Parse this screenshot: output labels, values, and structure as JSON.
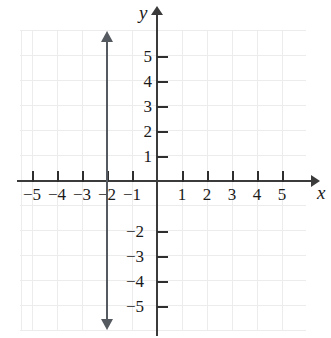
{
  "chart_data": {
    "type": "line",
    "title": "",
    "xlabel": "x",
    "ylabel": "y",
    "xlim": [
      -5.6,
      6.4
    ],
    "ylim": [
      -6.0,
      6.8
    ],
    "grid": true,
    "legend": "none",
    "x_ticks": [
      -5,
      -4,
      -3,
      -2,
      -1,
      1,
      2,
      3,
      4,
      5
    ],
    "y_ticks": [
      5,
      4,
      3,
      2,
      1,
      -2,
      -3,
      -4,
      -5
    ],
    "x_tick_labels": [
      "−5",
      "−4",
      "−3",
      "−2",
      "−1",
      "1",
      "2",
      "3",
      "4",
      "5"
    ],
    "y_tick_labels": [
      "5",
      "4",
      "3",
      "2",
      "1",
      "−2",
      "−3",
      "−4",
      "−5"
    ],
    "series": [
      {
        "name": "x = -2",
        "equation": "x = −2",
        "orientation": "vertical",
        "x_intercept": -2,
        "x": [
          -2,
          -2
        ],
        "y": [
          -6.0,
          6.0
        ],
        "arrows": "both",
        "color": "#555a60"
      }
    ],
    "annotations": [],
    "axis_color": "#3b3b3b",
    "grid_color": "#e9e9e9"
  },
  "axes": {
    "x_name": "x",
    "y_name": "y"
  },
  "x_labels": [
    {
      "text": "−5",
      "left": 21
    },
    {
      "text": "−4",
      "left": 46
    },
    {
      "text": "−3",
      "left": 71
    },
    {
      "text": "−2",
      "left": 96
    },
    {
      "text": "−1",
      "left": 121
    },
    {
      "text": "1",
      "left": 171
    },
    {
      "text": "2",
      "left": 196
    },
    {
      "text": "3",
      "left": 221
    },
    {
      "text": "4",
      "left": 246
    },
    {
      "text": "5",
      "left": 271
    }
  ],
  "y_labels": [
    {
      "text": "5",
      "top": 48,
      "left": 126
    },
    {
      "text": "4",
      "top": 73,
      "left": 126
    },
    {
      "text": "3",
      "top": 98,
      "left": 126
    },
    {
      "text": "2",
      "top": 123,
      "left": 126
    },
    {
      "text": "1",
      "top": 148,
      "left": 126
    },
    {
      "text": "−2",
      "top": 223,
      "left": 118
    },
    {
      "text": "−3",
      "top": 248,
      "left": 118
    },
    {
      "text": "−4",
      "top": 273,
      "left": 118
    },
    {
      "text": "−5",
      "top": 298,
      "left": 118
    }
  ],
  "x_ticks_px": [
    32,
    57,
    82,
    107,
    132,
    182,
    207,
    232,
    257,
    282
  ],
  "y_ticks_px": [
    56,
    81,
    106,
    131,
    156,
    231,
    256,
    281,
    306
  ]
}
